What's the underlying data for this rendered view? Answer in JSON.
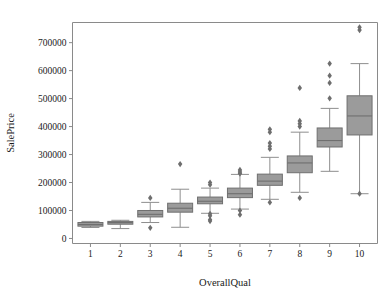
{
  "figure": {
    "background": "#ffffff",
    "box_fill": "#9b9b9b",
    "box_edge": "#6f6f6f",
    "whisker_color": "#8e8e8e",
    "flier_color": "#6e6e6e",
    "spine_color": "#8a8a8a"
  },
  "chart_data": {
    "type": "box",
    "title": "",
    "xlabel": "OverallQual",
    "ylabel": "SalePrice",
    "categories": [
      "1",
      "2",
      "3",
      "4",
      "5",
      "6",
      "7",
      "8",
      "9",
      "10"
    ],
    "xtick_labels": [
      "1",
      "2",
      "3",
      "4",
      "5",
      "6",
      "7",
      "8",
      "9",
      "10"
    ],
    "ytick_labels": [
      "0",
      "100000",
      "200000",
      "300000",
      "400000",
      "500000",
      "600000",
      "700000"
    ],
    "yticks": [
      0,
      100000,
      200000,
      300000,
      400000,
      500000,
      600000,
      700000
    ],
    "ylim": [
      -18000,
      772000
    ],
    "xlim": [
      0.4,
      10.6
    ],
    "grid": false,
    "legend": null,
    "boxes": [
      {
        "category": "1",
        "whisker_low": 39300,
        "q1": 44000,
        "median": 50000,
        "q3": 57000,
        "whisker_high": 61000,
        "fliers": []
      },
      {
        "category": "2",
        "whisker_low": 35311,
        "q1": 51000,
        "median": 57000,
        "q3": 61000,
        "whisker_high": 65000,
        "fliers": []
      },
      {
        "category": "3",
        "whisker_low": 57000,
        "q1": 77000,
        "median": 86250,
        "q3": 100000,
        "whisker_high": 129000,
        "fliers": [
          145000,
          37900
        ]
      },
      {
        "category": "4",
        "whisker_low": 40000,
        "q1": 94000,
        "median": 108000,
        "q3": 126000,
        "whisker_high": 176000,
        "fliers": [
          265979
        ]
      },
      {
        "category": "5",
        "whisker_low": 90000,
        "q1": 124000,
        "median": 133000,
        "q3": 148000,
        "whisker_high": 180000,
        "fliers": [
          200000,
          192000,
          88000,
          81000,
          67000,
          62000
        ]
      },
      {
        "category": "6",
        "whisker_low": 105000,
        "q1": 146000,
        "median": 160000,
        "q3": 180000,
        "whisker_high": 229000,
        "fliers": [
          245000,
          238000,
          232000,
          100000,
          85000
        ]
      },
      {
        "category": "7",
        "whisker_low": 140000,
        "q1": 190000,
        "median": 205000,
        "q3": 230000,
        "whisker_high": 290000,
        "fliers": [
          390000,
          380000,
          341000,
          330000,
          320000,
          129000
        ]
      },
      {
        "category": "8",
        "whisker_low": 165000,
        "q1": 235000,
        "median": 270000,
        "q3": 295000,
        "whisker_high": 380000,
        "fliers": [
          420000,
          410000,
          400000,
          538000,
          145000
        ]
      },
      {
        "category": "9",
        "whisker_low": 240000,
        "q1": 327000,
        "median": 350000,
        "q3": 395000,
        "whisker_high": 465000,
        "fliers": [
          625000,
          582000,
          556000,
          501000
        ]
      },
      {
        "category": "10",
        "whisker_low": 160000,
        "q1": 370000,
        "median": 438000,
        "q3": 510000,
        "whisker_high": 625000,
        "fliers": [
          755000,
          745000,
          160000
        ]
      }
    ]
  }
}
